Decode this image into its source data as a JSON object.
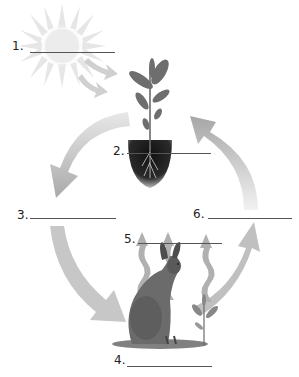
{
  "diagram": {
    "type": "cycle",
    "colors": {
      "arrow": "#b5b5b5",
      "sun": "#e2e2e2",
      "soil": "#1a1a1a",
      "plant": "#6e6e6e",
      "hare": "#6a6a6a",
      "line": "#555555"
    },
    "nodes": [
      {
        "id": "sun",
        "icon": "sun-icon"
      },
      {
        "id": "plant",
        "icon": "plant-icon"
      },
      {
        "id": "hare",
        "icon": "hare-icon"
      },
      {
        "id": "seedling",
        "icon": "seedling-icon"
      }
    ],
    "labels": [
      {
        "number": "1.",
        "answer": ""
      },
      {
        "number": "2.",
        "answer": ""
      },
      {
        "number": "3.",
        "answer": ""
      },
      {
        "number": "4.",
        "answer": ""
      },
      {
        "number": "5.",
        "answer": ""
      },
      {
        "number": "6.",
        "answer": ""
      }
    ]
  }
}
